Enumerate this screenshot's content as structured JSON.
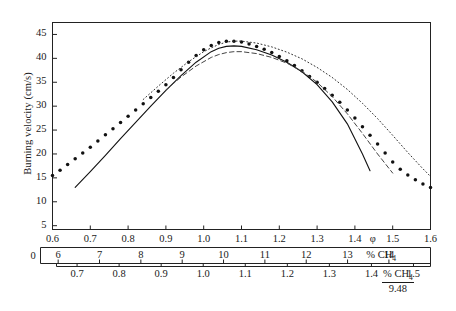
{
  "figure": {
    "ylabel": "Burning velocity (cm/s)",
    "axis_names": {
      "phi": "φ",
      "pct_ch4": "% CH",
      "pct_ch4_sub": "4",
      "frac_num": "% CH",
      "frac_num_sub": "4",
      "frac_den": "9.48"
    },
    "zero_label": "0"
  },
  "chart_data": {
    "type": "line",
    "title": "",
    "xlabel": "φ",
    "ylabel": "Burning velocity (cm/s)",
    "xlim": [
      0.6,
      1.6
    ],
    "ylim": [
      4.2,
      47.5
    ],
    "grid": false,
    "legend": "none",
    "x_axes": [
      {
        "name": "phi",
        "label": "φ",
        "ticks": [
          0.6,
          0.7,
          0.8,
          0.9,
          1.0,
          1.1,
          1.2,
          1.3,
          1.4,
          1.5,
          1.6
        ],
        "tick_labels": [
          "0.6",
          "0.7",
          "0.8",
          "0.9",
          "1.0",
          "1.1",
          "1.2",
          "1.3",
          "1.4",
          "1.5",
          "1.6"
        ]
      },
      {
        "name": "pct_ch4",
        "label": "% CH4",
        "ticks": [
          6,
          7,
          8,
          9,
          10,
          11,
          12,
          13,
          14
        ],
        "tick_labels": [
          "6",
          "7",
          "8",
          "9",
          "10",
          "11",
          "12",
          "13",
          "14"
        ],
        "left_edge_label": "0"
      },
      {
        "name": "pct_ch4_over_948",
        "label": "% CH4 / 9.48",
        "ticks": [
          0.7,
          0.8,
          0.9,
          1.0,
          1.1,
          1.2,
          1.3,
          1.4,
          1.5
        ],
        "tick_labels": [
          "0.7",
          "0.8",
          "0.9",
          "1.0",
          "1.1",
          "1.2",
          "1.3",
          "1.4",
          "1.5"
        ]
      }
    ],
    "y_ticks": [
      5,
      10,
      15,
      20,
      25,
      30,
      35,
      40,
      45
    ],
    "y_tick_labels": [
      "5",
      "10",
      "15",
      "20",
      "25",
      "30",
      "35",
      "40",
      "45"
    ],
    "series": [
      {
        "name": "experimental-points",
        "style": "dotted-markers",
        "marker": "filled-circle",
        "color": "#111111",
        "x": [
          0.6,
          0.62,
          0.64,
          0.66,
          0.68,
          0.7,
          0.72,
          0.74,
          0.76,
          0.78,
          0.8,
          0.82,
          0.84,
          0.86,
          0.88,
          0.9,
          0.92,
          0.94,
          0.96,
          0.98,
          1.0,
          1.02,
          1.04,
          1.06,
          1.08,
          1.1,
          1.12,
          1.14,
          1.16,
          1.18,
          1.2,
          1.22,
          1.24,
          1.26,
          1.28,
          1.3,
          1.32,
          1.34,
          1.36,
          1.38,
          1.4,
          1.42,
          1.44,
          1.46,
          1.48,
          1.5,
          1.52,
          1.54,
          1.56,
          1.58,
          1.6
        ],
        "y": [
          15.5,
          16.6,
          17.8,
          19.0,
          20.2,
          21.4,
          22.7,
          24.0,
          25.3,
          26.6,
          27.9,
          29.2,
          30.5,
          31.8,
          33.1,
          34.5,
          36.0,
          37.6,
          39.2,
          40.6,
          41.8,
          42.7,
          43.3,
          43.6,
          43.6,
          43.4,
          43.0,
          42.5,
          41.9,
          41.2,
          40.4,
          39.5,
          38.5,
          37.4,
          36.2,
          35.0,
          33.7,
          32.3,
          30.8,
          29.2,
          27.5,
          25.7,
          23.9,
          22.1,
          20.2,
          18.3,
          16.8,
          15.6,
          14.6,
          13.7,
          13.0
        ]
      },
      {
        "name": "solid-model",
        "style": "solid",
        "color": "#111111",
        "x": [
          0.66,
          0.7,
          0.74,
          0.78,
          0.82,
          0.86,
          0.9,
          0.94,
          0.98,
          1.02,
          1.04,
          1.06,
          1.08,
          1.1,
          1.14,
          1.18,
          1.22,
          1.26,
          1.3,
          1.34,
          1.38,
          1.42,
          1.44
        ],
        "y": [
          13.0,
          16.3,
          19.7,
          23.2,
          26.6,
          30.0,
          33.3,
          36.4,
          39.2,
          41.4,
          42.1,
          42.5,
          42.6,
          42.5,
          41.8,
          40.7,
          39.2,
          37.2,
          34.5,
          30.9,
          26.3,
          20.0,
          16.5
        ]
      },
      {
        "name": "dashed-model",
        "style": "dashed",
        "color": "#444444",
        "x": [
          0.9,
          0.94,
          0.98,
          1.02,
          1.04,
          1.06,
          1.08,
          1.1,
          1.14,
          1.18,
          1.22,
          1.26,
          1.3,
          1.34,
          1.38,
          1.42,
          1.46,
          1.5
        ],
        "y": [
          33.4,
          36.1,
          38.4,
          40.2,
          40.8,
          41.2,
          41.4,
          41.4,
          41.0,
          40.2,
          39.0,
          37.3,
          35.0,
          32.0,
          28.4,
          24.3,
          20.0,
          16.0
        ]
      },
      {
        "name": "fine-dotted-model",
        "style": "fine-dotted",
        "color": "#333333",
        "x": [
          0.84,
          0.88,
          0.92,
          0.96,
          1.0,
          1.02,
          1.04,
          1.06,
          1.08,
          1.1,
          1.14,
          1.18,
          1.22,
          1.26,
          1.3,
          1.34,
          1.38,
          1.42,
          1.46,
          1.5,
          1.54,
          1.58,
          1.6
        ],
        "y": [
          31.4,
          34.2,
          36.9,
          39.3,
          41.4,
          42.2,
          42.9,
          43.4,
          43.6,
          43.6,
          43.2,
          42.4,
          41.3,
          39.9,
          38.1,
          36.0,
          33.5,
          30.6,
          27.4,
          23.9,
          20.3,
          16.9,
          15.3
        ]
      }
    ]
  }
}
